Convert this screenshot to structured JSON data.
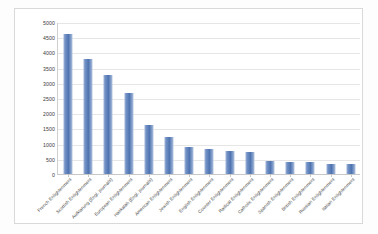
{
  "chart_data": {
    "type": "bar",
    "title": "",
    "subtitle": "",
    "xlabel": "",
    "ylabel": "",
    "ylim": [
      0,
      5000
    ],
    "ytick_step": 500,
    "grid": true,
    "legend": false,
    "bar_color": "#4f74b0",
    "categories": [
      "French Enlightenment",
      "Scottish Enlightenment",
      "Aufklarung (Engl. journals)",
      "European Enlightenment",
      "Haskalah (Engl. journals)",
      "American Enlightenment",
      "Jewish Enlightenment",
      "English Enlightenment",
      "Counter Enlightenment",
      "Radical Enlightenment",
      "Catholic Enlightenment",
      "Spanish Enlightenment",
      "British Enlightenment",
      "Russian Enlightenment",
      "Italian Enlightenment"
    ],
    "values": [
      4620,
      3790,
      3260,
      2680,
      1620,
      1230,
      900,
      810,
      760,
      740,
      420,
      400,
      390,
      330,
      330
    ],
    "yticks": [
      "0",
      "500",
      "1000",
      "1500",
      "2000",
      "2500",
      "3000",
      "3500",
      "4000",
      "4500",
      "5000"
    ]
  }
}
